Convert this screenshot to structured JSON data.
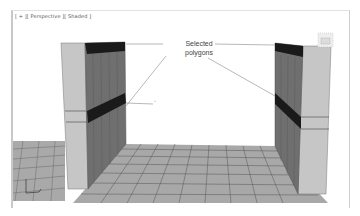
{
  "viewport": {
    "labels": {
      "plus": "[ + ]",
      "view": "[ Perspective ]",
      "shading": "[ Shaded ]"
    }
  },
  "annotation": {
    "line1": "Selected",
    "line2": "polygons"
  },
  "colors": {
    "selected_polygon": "#1a1a1a",
    "wall_side": "#6e6e6e",
    "wall_front": "#c4c4c4",
    "floor": "#a8a8a8",
    "floor_lines": "#555555",
    "callout_line": "#888888"
  },
  "icons": [
    "axis-gizmo-icon",
    "viewcube-icon"
  ]
}
